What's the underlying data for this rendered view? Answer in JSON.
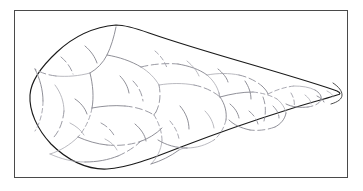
{
  "figure": {
    "kind": "line-drawing",
    "frame": {
      "border_color": "#4a4a4a",
      "border_width_px": 1,
      "background_color": "#ffffff",
      "x": 14,
      "y": 10,
      "width": 334,
      "height": 168
    },
    "colors": {
      "outline_stroke": "#1a1a1a",
      "scar_stroke": "#8a8a92",
      "scar_stroke_faint": "#a8a8b0",
      "background": "#ffffff"
    },
    "outline": {
      "stroke_width": 1.15,
      "closed": true,
      "extreme_points": {
        "top_apex": [
          101,
          14
        ],
        "left_edge": [
          15,
          84
        ],
        "bottom_low": [
          96,
          158
        ],
        "right_tip": [
          324,
          83
        ]
      }
    },
    "geometry": {
      "outline_d": "M 101 14 C 78 16 58 26 42 41 C 28 54 16 68 15 84 C 14 100 22 118 36 133 C 52 149 72 159 92 158 C 112 157 138 147 166 136 C 200 123 240 109 272 99 C 296 91 314 87 322 84 C 326 83 326 82 322 80 C 306 74 272 64 238 54 C 200 43 160 31 134 22 C 120 17 110 14 101 14 Z",
      "tip_inner_d": "M 318 72 C 324 76 327 80 327 84 C 327 88 323 91 316 93",
      "scars": [
        "M 101 16 C 99 26 96 36 92 44 C 88 52 82 58 75 62",
        "M 75 62 C 64 65 52 66 41 65",
        "M 41 65 C 33 64 26 62 20 58",
        "M 75 62 C 78 74 79 86 77 97",
        "M 77 97 C 75 108 70 118 63 126",
        "M 63 126 C 55 134 45 140 35 143",
        "M 77 97 C 88 95 99 94 110 95",
        "M 110 95 C 121 96 131 99 139 104",
        "M 92 44 C 104 46 116 50 126 56",
        "M 126 56 C 134 61 140 67 144 74",
        "M 144 74 C 146 84 145 93 141 101",
        "M 141 101 C 139 103 139 104 139 104",
        "M 139 104 C 144 112 147 121 147 130",
        "M 147 130 C 146 139 142 147 136 153",
        "M 63 126 C 72 130 82 133 92 134",
        "M 92 134 C 103 135 114 134 124 131",
        "M 124 131 C 133 128 141 123 147 117",
        "M 144 74 C 156 72 168 72 179 74",
        "M 179 74 C 189 76 198 80 205 86",
        "M 205 86 C 210 93 212 101 211 109",
        "M 211 109 C 209 117 205 124 199 129",
        "M 199 129 C 191 134 182 137 172 137",
        "M 172 137 C 161 137 151 134 143 129",
        "M 126 56 C 138 53 151 52 163 53",
        "M 163 53 C 174 55 184 58 192 64",
        "M 192 64 C 198 69 202 75 204 82",
        "M 204 82 C 204 84 205 85 205 86",
        "M 205 86 C 216 83 227 81 238 81",
        "M 238 81 C 247 82 255 84 262 88",
        "M 262 88 C 267 92 270 97 271 102",
        "M 271 102 C 270 108 266 113 260 116",
        "M 260 116 C 252 119 243 120 235 119",
        "M 235 119 C 226 117 219 114 214 109",
        "M 192 64 C 203 62 214 62 224 64",
        "M 224 64 C 233 66 241 70 247 75",
        "M 247 75 C 250 78 252 80 253 83",
        "M 253 83 C 261 79 270 76 279 75",
        "M 279 75 C 287 75 294 76 300 79",
        "M 300 79 C 305 82 307 85 306 89",
        "M 306 89 C 304 93 299 95 293 96",
        "M 293 96 C 285 97 277 96 271 93",
        "M 40 74 C 46 82 49 91 49 100",
        "M 49 100 C 48 110 45 119 39 126",
        "M 20 58 C 25 68 28 79 28 90",
        "M 28 90 C 28 101 25 112 20 120",
        "M 35 143 C 46 148 58 151 70 151",
        "M 70 151 C 82 151 93 149 103 145",
        "M 103 145 C 112 141 120 136 126 130",
        "M 136 153 C 146 150 156 145 164 139",
        "M 164 139 C 168 137 170 137 172 137",
        "M 248 86 C 251 94 251 102 249 110",
        "M 230 70 C 234 76 236 82 236 88",
        "M 276 82 C 279 87 280 92 279 96",
        "M 290 84 C 294 87 296 90 296 93",
        "M 165 95 C 171 102 174 110 174 118",
        "M 118 70 C 124 76 127 83 128 90",
        "M 60 88 C 66 92 70 97 72 103",
        "M 55 112 C 61 115 66 119 69 124",
        "M 86 112 C 92 115 97 120 100 126",
        "M 105 65 C 110 70 113 76 114 82",
        "M 155 110 C 160 116 163 122 164 128",
        "M 190 100 C 195 105 198 111 199 117",
        "M 215 93 C 220 97 223 102 224 107",
        "M 258 95 C 262 99 264 103 264 107",
        "M 302 85 C 306 87 308 89 309 91",
        "M 312 80 C 316 82 318 84 318 86",
        "M 46 46 C 52 51 56 57 58 63",
        "M 70 35 C 76 40 80 46 82 52",
        "M 140 40 C 146 45 150 51 152 57",
        "M 172 50 C 178 55 182 60 184 65",
        "M 203 58 C 208 62 212 67 213 71",
        "M 234 100 C 239 104 242 109 243 113",
        "M 120 113 C 126 118 130 124 131 130",
        "M 90 128 C 96 131 100 135 102 139"
      ]
    }
  },
  "page": {
    "alt_text": "Line drawing of a teardrop-shaped flaked stone tool with flake scars, enclosed in a thin rectangular frame."
  }
}
